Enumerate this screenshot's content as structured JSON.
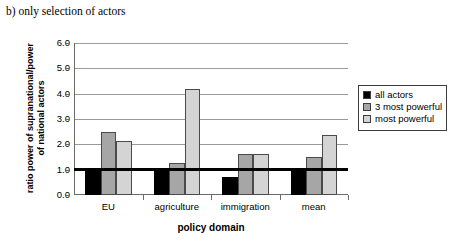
{
  "caption": "b) only selection of actors",
  "chart_data": {
    "type": "bar",
    "title": "b) only selection of actors",
    "xlabel": "policy domain",
    "ylabel": "ratio power of supranational/power of national actors",
    "categories": [
      "EU",
      "agriculture",
      "immigration",
      "mean"
    ],
    "series": [
      {
        "name": "all actors",
        "color": "#000000",
        "values": [
          1.0,
          1.0,
          0.7,
          1.0
        ]
      },
      {
        "name": "3 most powerful",
        "color": "#a6a6a6",
        "values": [
          2.5,
          1.25,
          1.6,
          1.5
        ]
      },
      {
        "name": "most powerful",
        "color": "#d4d4d4",
        "values": [
          2.15,
          4.2,
          1.6,
          2.35
        ]
      }
    ],
    "ylim": [
      0.0,
      6.0
    ],
    "ytick_labels": [
      "0.0",
      "1.0",
      "2.0",
      "3.0",
      "4.0",
      "5.0",
      "6.0"
    ],
    "ytick_values": [
      0.0,
      1.0,
      2.0,
      3.0,
      4.0,
      5.0,
      6.0
    ],
    "grid": true,
    "reference_line": 1.0,
    "legend_position": "right"
  },
  "legend": {
    "items": [
      {
        "label": "all actors",
        "color": "#000000"
      },
      {
        "label": "3 most powerful",
        "color": "#a6a6a6"
      },
      {
        "label": "most powerful",
        "color": "#d4d4d4"
      }
    ]
  },
  "axes": {
    "x_title": "policy domain",
    "y_title": "ratio power of supranational/power of national actors"
  }
}
